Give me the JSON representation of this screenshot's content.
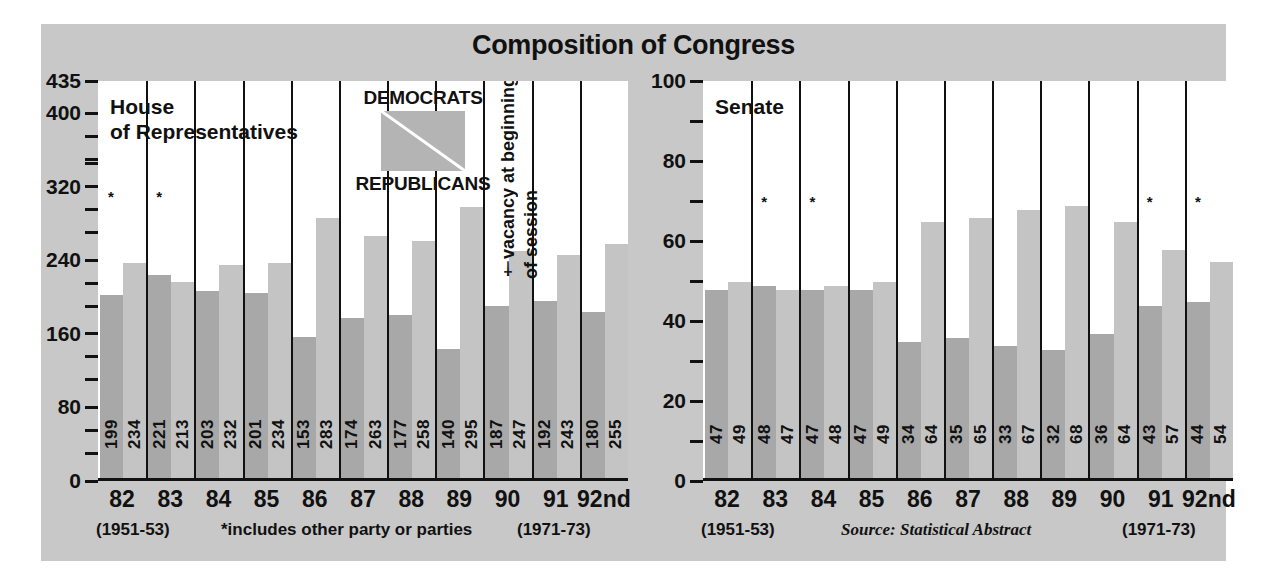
{
  "title": "Composition of Congress",
  "legend": {
    "top_label": "DEMOCRATS",
    "bottom_label": "REPUBLICANS",
    "democrat_color": "#a8a8a8",
    "republican_color": "#c4c4c4"
  },
  "vacancy_note": {
    "line1": "†vacancy at beginning",
    "line2": "of session"
  },
  "footnotes": {
    "house_left": "(1951-53)",
    "house_mid": "*includes other party or parties",
    "house_right": "(1971-73)",
    "senate_left": "(1951-53)",
    "senate_mid": "Source: Statistical Abstract",
    "senate_right": "(1971-73)"
  },
  "chart_data": [
    {
      "type": "bar",
      "title": "House of Representatives",
      "panel": "house",
      "xlabel": "",
      "ylabel": "",
      "ylim": [
        0,
        435
      ],
      "grid": false,
      "legend_position": "inside-top-center",
      "categories": [
        "82",
        "83",
        "84",
        "85",
        "86",
        "87",
        "88",
        "89",
        "90",
        "91",
        "92nd"
      ],
      "ytick_labels": [
        "435",
        "400",
        "320",
        "240",
        "160",
        "80",
        "0"
      ],
      "ytick_values": [
        435,
        400,
        320,
        240,
        160,
        80,
        0
      ],
      "yminor_values": [
        375,
        350,
        345,
        295,
        270,
        215,
        190,
        135,
        110,
        55,
        30
      ],
      "series": [
        {
          "name": "DEMOCRATS",
          "values": [
            199,
            221,
            203,
            201,
            153,
            174,
            177,
            140,
            187,
            192,
            180
          ]
        },
        {
          "name": "REPUBLICANS",
          "values": [
            234,
            213,
            232,
            234,
            283,
            263,
            258,
            295,
            247,
            243,
            255
          ]
        }
      ],
      "asterisk_marks": [
        {
          "category": "82",
          "series": "DEMOCRATS"
        },
        {
          "category": "83",
          "series": "DEMOCRATS"
        }
      ],
      "annotations": [
        "†vacancy at beginning of session"
      ]
    },
    {
      "type": "bar",
      "title": "Senate",
      "panel": "senate",
      "xlabel": "",
      "ylabel": "",
      "ylim": [
        0,
        100
      ],
      "grid": false,
      "legend_position": "none",
      "categories": [
        "82",
        "83",
        "84",
        "85",
        "86",
        "87",
        "88",
        "89",
        "90",
        "91",
        "92nd"
      ],
      "ytick_labels": [
        "100",
        "80",
        "60",
        "40",
        "20",
        "0"
      ],
      "ytick_values": [
        100,
        80,
        60,
        40,
        20,
        0
      ],
      "yminor_values": [
        90,
        70,
        50,
        30,
        10
      ],
      "series": [
        {
          "name": "DEMOCRATS",
          "values": [
            47,
            48,
            47,
            47,
            34,
            35,
            33,
            32,
            36,
            43,
            44
          ]
        },
        {
          "name": "REPUBLICANS",
          "values": [
            49,
            47,
            48,
            49,
            64,
            65,
            67,
            68,
            64,
            57,
            54
          ]
        }
      ],
      "asterisk_marks": [
        {
          "category": "83",
          "series": "DEMOCRATS"
        },
        {
          "category": "84",
          "series": "DEMOCRATS"
        },
        {
          "category": "91",
          "series": "DEMOCRATS"
        },
        {
          "category": "92nd",
          "series": "DEMOCRATS"
        }
      ],
      "annotations": []
    }
  ]
}
